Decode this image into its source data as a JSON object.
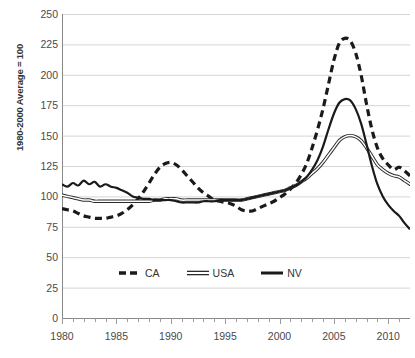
{
  "chart_data": {
    "type": "line",
    "title": "",
    "xlabel": "",
    "ylabel": "1980-2000 Average = 100",
    "xlim": [
      1980,
      2012
    ],
    "ylim": [
      0,
      250
    ],
    "grid": true,
    "legend_position": "bottom-center",
    "x_ticks": [
      1980,
      1985,
      1990,
      1995,
      2000,
      2005,
      2010
    ],
    "x_minor_tick_interval": 1,
    "y_ticks": [
      0,
      25,
      50,
      75,
      100,
      125,
      150,
      175,
      200,
      225,
      250
    ],
    "x": [
      1980,
      1980.5,
      1981,
      1981.5,
      1982,
      1982.5,
      1983,
      1983.5,
      1984,
      1984.5,
      1985,
      1985.5,
      1986,
      1986.5,
      1987,
      1987.5,
      1988,
      1988.5,
      1989,
      1989.5,
      1990,
      1990.5,
      1991,
      1991.5,
      1992,
      1992.5,
      1993,
      1993.5,
      1994,
      1994.5,
      1995,
      1995.5,
      1996,
      1996.5,
      1997,
      1997.5,
      1998,
      1998.5,
      1999,
      1999.5,
      2000,
      2000.5,
      2001,
      2001.5,
      2002,
      2002.5,
      2003,
      2003.5,
      2004,
      2004.5,
      2005,
      2005.5,
      2006,
      2006.5,
      2007,
      2007.5,
      2008,
      2008.5,
      2009,
      2009.5,
      2010,
      2010.5,
      2011,
      2011.5,
      2012
    ],
    "series": [
      {
        "name": "CA",
        "style": "dashed",
        "color": "#1a1a1a",
        "values": [
          90,
          89,
          88,
          86,
          84,
          83,
          82,
          82,
          82,
          83,
          84,
          86,
          89,
          93,
          98,
          104,
          111,
          118,
          124,
          127,
          128,
          126,
          122,
          117,
          112,
          107,
          103,
          100,
          97,
          96,
          95,
          94,
          92,
          89,
          88,
          88,
          90,
          92,
          94,
          96,
          99,
          102,
          106,
          111,
          118,
          127,
          140,
          155,
          172,
          192,
          212,
          226,
          230,
          228,
          218,
          200,
          176,
          155,
          140,
          131,
          126,
          122,
          124,
          121,
          117
        ]
      },
      {
        "name": "USA",
        "style": "hollow",
        "color": "#2b2b2b",
        "values": [
          101,
          100,
          99,
          98,
          97,
          97,
          96,
          96,
          96,
          96,
          96,
          96,
          96,
          96,
          96,
          96,
          96,
          97,
          97,
          98,
          98,
          98,
          97,
          97,
          97,
          97,
          97,
          97,
          97,
          97,
          97,
          97,
          97,
          97,
          98,
          99,
          100,
          101,
          102,
          103,
          104,
          105,
          107,
          109,
          112,
          115,
          119,
          123,
          128,
          134,
          140,
          146,
          149,
          150,
          149,
          146,
          140,
          133,
          126,
          122,
          119,
          117,
          116,
          113,
          110
        ]
      },
      {
        "name": "NV",
        "style": "solid",
        "color": "#1a1a1a",
        "values": [
          110,
          108,
          111,
          109,
          113,
          110,
          112,
          108,
          110,
          108,
          107,
          105,
          103,
          100,
          99,
          98,
          98,
          97,
          97,
          97,
          97,
          96,
          95,
          95,
          95,
          95,
          96,
          96,
          96,
          97,
          97,
          97,
          97,
          97,
          98,
          99,
          100,
          101,
          102,
          103,
          104,
          105,
          107,
          109,
          112,
          116,
          122,
          130,
          141,
          155,
          168,
          177,
          180,
          179,
          172,
          160,
          143,
          125,
          110,
          100,
          93,
          88,
          84,
          78,
          73
        ]
      }
    ]
  },
  "legend": {
    "items": [
      {
        "label": "CA",
        "style": "dashed"
      },
      {
        "label": "USA",
        "style": "hollow"
      },
      {
        "label": "NV",
        "style": "solid"
      }
    ]
  }
}
